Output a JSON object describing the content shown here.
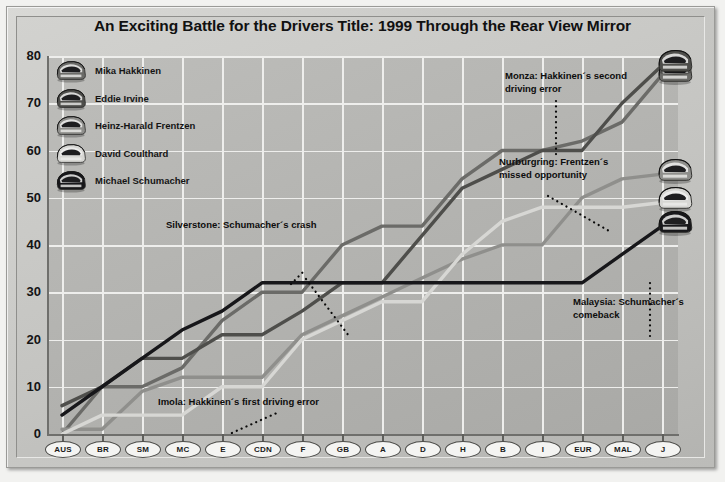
{
  "title": "An Exciting Battle for the Drivers Title: 1999 Through the Rear View Mirror",
  "legend": {
    "items": [
      {
        "label": "Mika Hakkinen",
        "icon": "helmet-icon",
        "color": "#6b6b68"
      },
      {
        "label": "Eddie Irvine",
        "icon": "helmet-icon",
        "color": "#4e4e4b"
      },
      {
        "label": "Heinz-Harald Frentzen",
        "icon": "helmet-icon",
        "color": "#8f8f8c"
      },
      {
        "label": "David Coulthard",
        "icon": "helmet-icon",
        "color": "#d7d7d4"
      },
      {
        "label": "Michael Schumacher",
        "icon": "helmet-icon",
        "color": "#17171a"
      }
    ]
  },
  "annotations": [
    {
      "id": "silverstone",
      "text_line1": "Silverstone: Schumacher´s crash",
      "text_line2": ""
    },
    {
      "id": "imola",
      "text_line1": "Imola: Hakkinen´s first driving error",
      "text_line2": ""
    },
    {
      "id": "monza",
      "text_line1": "Monza: Hakkinen´s second",
      "text_line2": "driving error"
    },
    {
      "id": "nurburgring",
      "text_line1": "Nurburgring: Frentzen´s",
      "text_line2": "missed opportunity"
    },
    {
      "id": "malaysia",
      "text_line1": "Malaysia: Schumacher´s",
      "text_line2": "comeback"
    }
  ],
  "chart_data": {
    "type": "line",
    "title": "An Exciting Battle for the Drivers Title: 1999 Through the Rear View Mirror",
    "xlabel": "",
    "ylabel": "",
    "ylim": [
      0,
      80
    ],
    "yticks": [
      0,
      10,
      20,
      30,
      40,
      50,
      60,
      70,
      80
    ],
    "grid": true,
    "legend_position": "upper-left",
    "categories": [
      "AUS",
      "BR",
      "SM",
      "MC",
      "E",
      "CDN",
      "F",
      "GB",
      "A",
      "D",
      "H",
      "B",
      "I",
      "EUR",
      "MAL",
      "J"
    ],
    "series": [
      {
        "name": "Mika Hakkinen",
        "color": "#6b6b68",
        "values": [
          0,
          10,
          10,
          14,
          24,
          30,
          30,
          40,
          44,
          44,
          54,
          60,
          60,
          62,
          66,
          76
        ]
      },
      {
        "name": "Eddie Irvine",
        "color": "#4e4e4b",
        "values": [
          6,
          10,
          16,
          16,
          21,
          21,
          26,
          32,
          32,
          42,
          52,
          56,
          60,
          60,
          70,
          78
        ]
      },
      {
        "name": "Heinz-Harald Frentzen",
        "color": "#8f8f8c",
        "values": [
          1,
          1,
          9,
          12,
          12,
          12,
          21,
          25,
          29,
          33,
          37,
          40,
          40,
          50,
          54,
          55
        ]
      },
      {
        "name": "David Coulthard",
        "color": "#d7d7d4",
        "values": [
          0,
          4,
          4,
          4,
          10,
          10,
          20,
          24,
          28,
          28,
          38,
          45,
          48,
          48,
          48,
          49
        ]
      },
      {
        "name": "Michael Schumacher",
        "color": "#17171a",
        "values": [
          4,
          10,
          16,
          22,
          26,
          32,
          32,
          32,
          32,
          32,
          32,
          32,
          32,
          32,
          38,
          44
        ]
      }
    ]
  }
}
